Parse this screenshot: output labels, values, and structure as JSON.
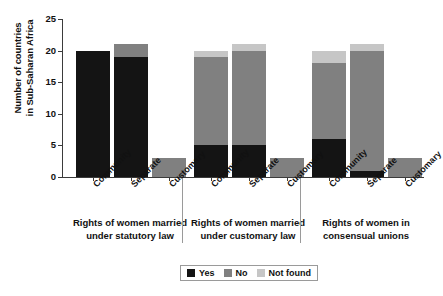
{
  "chart_data": {
    "type": "bar",
    "subtype": "stacked-bar-grouped",
    "title": "",
    "xlabel": "",
    "ylabel": "Number of countries in Sub-Saharan Africa",
    "ylabel_lines": [
      "Number of countries",
      "in Sub-Saharan Africa"
    ],
    "ylim": [
      0,
      25
    ],
    "yticks": [
      0,
      5,
      10,
      15,
      20,
      25
    ],
    "grid": false,
    "legend_position": "bottom-center",
    "categories": [
      "Community",
      "Separate",
      "Customary"
    ],
    "series": [
      {
        "name": "Yes",
        "color": "#141414"
      },
      {
        "name": "No",
        "color": "#808080"
      },
      {
        "name": "Not found",
        "color": "#c6c6c6"
      }
    ],
    "groups": [
      {
        "caption": "Rights of women married under statutory law",
        "caption_lines": [
          "Rights of women married",
          "under statutory law"
        ],
        "bars": [
          {
            "category": "Community",
            "Yes": 20,
            "No": 0,
            "Not found": 0,
            "total": 20
          },
          {
            "category": "Separate",
            "Yes": 19,
            "No": 2,
            "Not found": 0,
            "total": 21
          },
          {
            "category": "Customary",
            "Yes": 0,
            "No": 3,
            "Not found": 0,
            "total": 3
          }
        ]
      },
      {
        "caption": "Rights of women married under customary law",
        "caption_lines": [
          "Rights of women married",
          "under customary law"
        ],
        "bars": [
          {
            "category": "Community",
            "Yes": 5,
            "No": 14,
            "Not found": 1,
            "total": 20
          },
          {
            "category": "Separate",
            "Yes": 5,
            "No": 15,
            "Not found": 1,
            "total": 21
          },
          {
            "category": "Customary",
            "Yes": 0,
            "No": 3,
            "Not found": 0,
            "total": 3
          }
        ]
      },
      {
        "caption": "Rights of women in consensual unions",
        "caption_lines": [
          "Rights of women in",
          "consensual unions"
        ],
        "bars": [
          {
            "category": "Community",
            "Yes": 6,
            "No": 12,
            "Not found": 2,
            "total": 20
          },
          {
            "category": "Separate",
            "Yes": 1,
            "No": 19,
            "Not found": 1,
            "total": 21
          },
          {
            "category": "Customary",
            "Yes": 0,
            "No": 3,
            "Not found": 0,
            "total": 3
          }
        ]
      }
    ]
  },
  "legend": {
    "items": [
      {
        "label": "Yes",
        "color": "#141414"
      },
      {
        "label": "No",
        "color": "#808080"
      },
      {
        "label": "Not found",
        "color": "#c6c6c6"
      }
    ]
  }
}
